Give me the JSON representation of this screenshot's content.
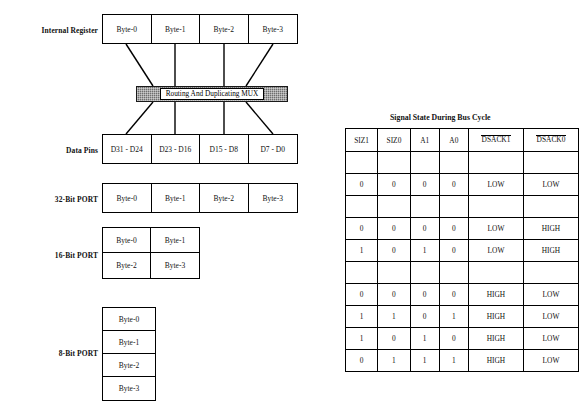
{
  "diagram": {
    "rows": [
      {
        "label": "Internal Register",
        "cells": [
          "Byte-0",
          "Byte-1",
          "Byte-2",
          "Byte-3"
        ]
      },
      {
        "label": "Data Pins",
        "cells": [
          "D31 - D24",
          "D23 - D16",
          "D15 - D8",
          "D7 - D0"
        ]
      },
      {
        "label": "32-Bit PORT",
        "cells": [
          "Byte-0",
          "Byte-1",
          "Byte-2",
          "Byte-3"
        ]
      }
    ],
    "port16": {
      "label": "16-Bit PORT",
      "cells": [
        "Byte-0",
        "Byte-1",
        "Byte-2",
        "Byte-3"
      ]
    },
    "port8": {
      "label": "8-Bit PORT",
      "cells": [
        "Byte-0",
        "Byte-1",
        "Byte-2",
        "Byte-3"
      ]
    },
    "mux": {
      "label": "Routing And Duplicating MUX",
      "fill_color": "#6e6e6e"
    }
  },
  "table": {
    "caption": "Signal State During Bus Cycle",
    "headers": [
      "SIZ1",
      "SIZ0",
      "A1",
      "A0",
      "DSACK1",
      "DSACK0"
    ],
    "headers_overlined": [
      false,
      false,
      false,
      false,
      true,
      true
    ],
    "rows": [
      {
        "type": "spacer",
        "cells": [
          "",
          "",
          "",
          "",
          "",
          ""
        ]
      },
      {
        "type": "data",
        "cells": [
          "0",
          "0",
          "0",
          "0",
          "LOW",
          "LOW"
        ]
      },
      {
        "type": "spacer",
        "cells": [
          "",
          "",
          "",
          "",
          "",
          ""
        ]
      },
      {
        "type": "data",
        "cells": [
          "0",
          "0",
          "0",
          "0",
          "LOW",
          "HIGH"
        ]
      },
      {
        "type": "data",
        "cells": [
          "1",
          "0",
          "1",
          "0",
          "LOW",
          "HIGH"
        ]
      },
      {
        "type": "spacer",
        "cells": [
          "",
          "",
          "",
          "",
          "",
          ""
        ]
      },
      {
        "type": "data",
        "cells": [
          "0",
          "0",
          "0",
          "0",
          "HIGH",
          "LOW"
        ]
      },
      {
        "type": "data",
        "cells": [
          "1",
          "1",
          "0",
          "1",
          "HIGH",
          "LOW"
        ]
      },
      {
        "type": "data",
        "cells": [
          "1",
          "0",
          "1",
          "0",
          "HIGH",
          "LOW"
        ]
      },
      {
        "type": "data",
        "cells": [
          "0",
          "1",
          "1",
          "1",
          "HIGH",
          "LOW"
        ]
      }
    ]
  }
}
